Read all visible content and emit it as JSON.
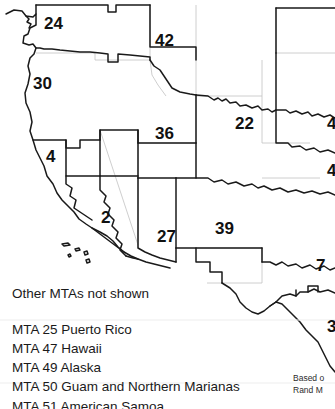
{
  "map": {
    "title_region": "Western United States MTA map",
    "regions": [
      {
        "number": "24",
        "x": 44,
        "y": 15
      },
      {
        "number": "42",
        "x": 155,
        "y": 32
      },
      {
        "number": "30",
        "x": 33,
        "y": 75
      },
      {
        "number": "36",
        "x": 155,
        "y": 125
      },
      {
        "number": "22",
        "x": 235,
        "y": 115
      },
      {
        "number": "4",
        "x": 46,
        "y": 148
      },
      {
        "number": "2",
        "x": 101,
        "y": 209
      },
      {
        "number": "27",
        "x": 157,
        "y": 228
      },
      {
        "number": "39",
        "x": 215,
        "y": 220
      },
      {
        "number": "7",
        "x": 316,
        "y": 257
      },
      {
        "number": "4",
        "x": 327,
        "y": 115
      },
      {
        "number": "4",
        "x": 327,
        "y": 162
      },
      {
        "number": "3",
        "x": 327,
        "y": 318
      }
    ],
    "colors": {
      "mta_boundary": "#1a1a1a",
      "state_boundary": "#b9b9b9",
      "background": "#ffffff",
      "label": "#111111"
    }
  },
  "legend": {
    "heading": "Other MTAs not shown",
    "items": [
      "MTA 25 Puerto Rico",
      "MTA 47 Hawaii",
      "MTA 49 Alaska",
      "MTA 50 Guam and Northern Marianas",
      "MTA 51 American Samoa"
    ]
  },
  "source_note": {
    "line1": "Based o",
    "line2": "Rand M"
  }
}
